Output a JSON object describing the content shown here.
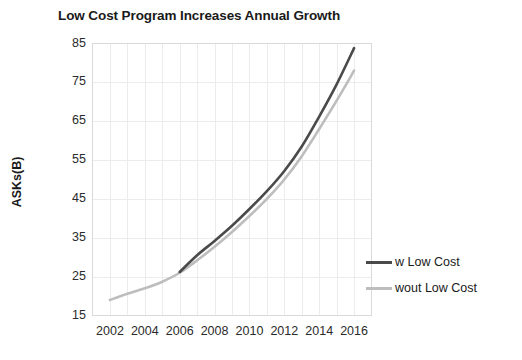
{
  "chart_data": {
    "type": "line",
    "title": "Low Cost Program Increases Annual Growth",
    "xlabel": "",
    "ylabel": "ASKs(B)",
    "xlim": [
      2001,
      2017
    ],
    "ylim": [
      15,
      85
    ],
    "ytick_step": 10,
    "xtick_step": 2,
    "grid": true,
    "legend_position": "right",
    "yticks": [
      15,
      25,
      35,
      45,
      55,
      65,
      75,
      85
    ],
    "xticks": [
      2002,
      2004,
      2006,
      2008,
      2010,
      2012,
      2014,
      2016
    ],
    "x": [
      2002,
      2003,
      2004,
      2005,
      2006,
      2007,
      2008,
      2009,
      2010,
      2011,
      2012,
      2013,
      2014,
      2015,
      2016
    ],
    "series": [
      {
        "name": "w Low Cost",
        "color": "#4a4a4a",
        "values": [
          null,
          null,
          null,
          null,
          26.2,
          30.5,
          34.2,
          38.1,
          42.4,
          47.0,
          52.2,
          58.5,
          66.2,
          74.5,
          83.8
        ]
      },
      {
        "name": "wout Low Cost",
        "color": "#bdbdbd",
        "values": [
          19.0,
          20.6,
          22.0,
          23.7,
          26.0,
          29.2,
          32.7,
          36.5,
          40.6,
          45.0,
          50.0,
          56.0,
          63.0,
          70.3,
          78.0
        ]
      }
    ]
  },
  "legend": {
    "items": [
      {
        "label": "w Low Cost",
        "color": "#4a4a4a"
      },
      {
        "label": "wout Low Cost",
        "color": "#bdbdbd"
      }
    ]
  },
  "axes": {
    "y_title": "ASKs(B)",
    "y_labels": [
      "85",
      "75",
      "65",
      "55",
      "45",
      "35",
      "25",
      "15"
    ],
    "x_labels": [
      "2002",
      "2004",
      "2006",
      "2008",
      "2010",
      "2012",
      "2014",
      "2016"
    ]
  },
  "style": {
    "plot_border": "#d9d9d9",
    "gridline": "#ececec",
    "background": "#ffffff"
  }
}
